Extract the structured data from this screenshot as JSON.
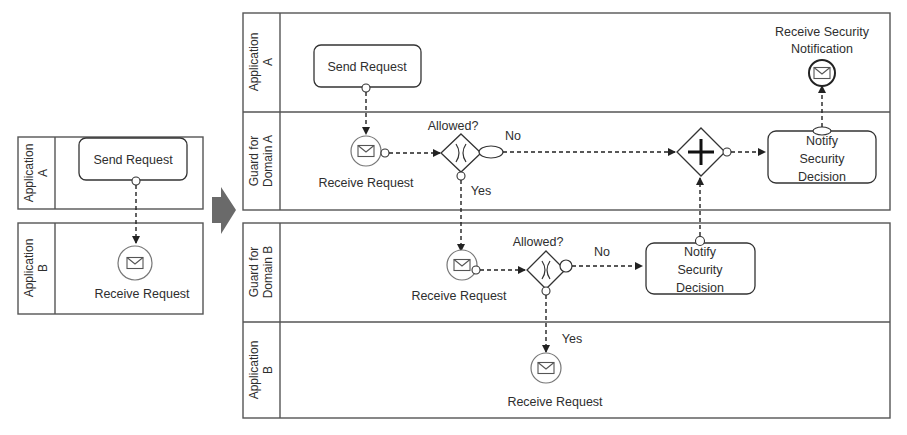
{
  "before": {
    "pools": [
      {
        "label_line1": "Application",
        "label_line2": "A"
      },
      {
        "label_line1": "Application",
        "label_line2": "B"
      }
    ],
    "task_send": "Send Request",
    "event_receive": "Receive Request"
  },
  "transform_arrow": {
    "icon": "right-arrow-icon",
    "color": "#666666"
  },
  "after": {
    "pool_top": {
      "lanes": [
        {
          "label_line1": "Application",
          "label_line2": "A"
        },
        {
          "label_line1": "Guard for",
          "label_line2": "Domain A"
        }
      ]
    },
    "pool_bottom": {
      "lanes": [
        {
          "label_line1": "Guard for",
          "label_line2": "Domain B"
        },
        {
          "label_line1": "Application",
          "label_line2": "B"
        }
      ]
    },
    "task_send": "Send Request",
    "event_receive_security_line1": "Receive Security",
    "event_receive_security_line2": "Notification",
    "guard_a": {
      "receive": "Receive Request",
      "gateway_label": "Allowed?",
      "no": "No",
      "yes": "Yes",
      "notify_line1": "Notify",
      "notify_line2": "Security",
      "notify_line3": "Decision"
    },
    "guard_b": {
      "receive": "Receive Request",
      "gateway_label": "Allowed?",
      "no": "No",
      "yes": "Yes",
      "notify_line1": "Notify",
      "notify_line2": "Security",
      "notify_line3": "Decision"
    },
    "app_b_receive": "Receive Request"
  },
  "colors": {
    "stroke": "#4a4a4a",
    "arrow_fill": "#6a6a6a",
    "background": "#ffffff"
  }
}
